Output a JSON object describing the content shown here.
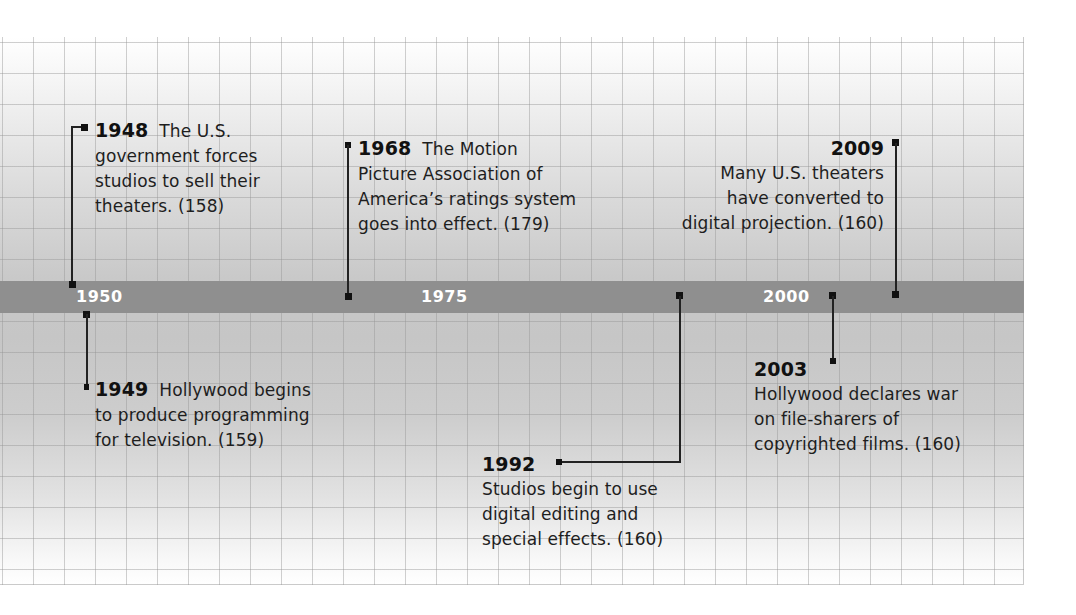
{
  "timeline": {
    "axis_labels": [
      "1950",
      "1975",
      "2000"
    ],
    "events": [
      {
        "year": "1948",
        "text": "The U.S. government forces studios to sell their theaters. (158)",
        "lines": [
          "The U.S.",
          "government forces",
          "studios to sell their",
          "theaters. (158)"
        ],
        "page": "158",
        "position": "above"
      },
      {
        "year": "1949",
        "text": "Hollywood begins to produce programming for television. (159)",
        "lines": [
          "Hollywood begins",
          "to produce programming",
          "for television. (159)"
        ],
        "page": "159",
        "position": "below"
      },
      {
        "year": "1968",
        "text": "The Motion Picture Association of America’s ratings system goes into effect. (179)",
        "lines": [
          "The Motion",
          "Picture Association of",
          "America’s ratings system",
          "goes into effect. (179)"
        ],
        "page": "179",
        "position": "above"
      },
      {
        "year": "1992",
        "text": "Studios begin to use digital editing and special effects. (160)",
        "lines": [
          "Studios begin to use",
          "digital editing and",
          "special effects. (160)"
        ],
        "page": "160",
        "position": "below"
      },
      {
        "year": "2003",
        "text": "Hollywood declares war on file-sharers of copyrighted films. (160)",
        "lines": [
          "Hollywood declares war",
          "on file-sharers of",
          "copyrighted films. (160)"
        ],
        "page": "160",
        "position": "below"
      },
      {
        "year": "2009",
        "text": "Many U.S. theaters have converted to digital projection. (160)",
        "lines": [
          "Many U.S. theaters",
          "have converted to",
          "digital projection. (160)"
        ],
        "page": "160",
        "position": "above"
      }
    ]
  },
  "colors": {
    "bar": "#8f8f8f",
    "axis_label": "#ffffff",
    "text": "#1e1e1e",
    "connector": "#222222"
  }
}
